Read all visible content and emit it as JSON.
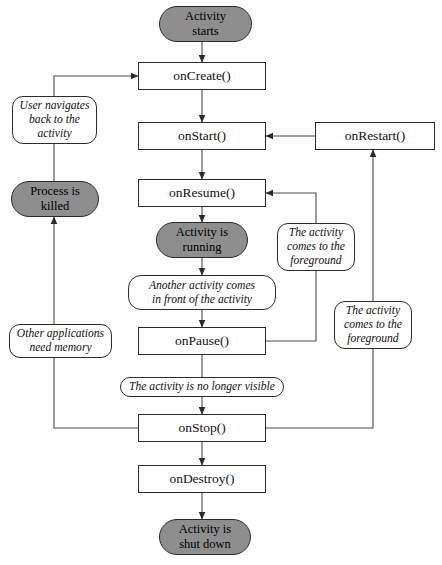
{
  "diagram": {
    "colors": {
      "state_fill": "#8e8e8e",
      "box_fill": "#ffffff",
      "stroke": "#2b2b2b",
      "background": "#ffffff"
    },
    "nodes": [
      {
        "id": "activity_starts",
        "label": "Activity\nstarts",
        "kind": "state",
        "x": 159,
        "y": 6,
        "w": 93,
        "h": 36
      },
      {
        "id": "on_create",
        "label": "onCreate()",
        "kind": "box",
        "x": 138,
        "y": 62,
        "w": 128,
        "h": 28
      },
      {
        "id": "user_navigates",
        "label": "User navigates\nback to the\nactivity",
        "kind": "cond",
        "x": 12,
        "y": 96,
        "w": 85,
        "h": 48
      },
      {
        "id": "on_start",
        "label": "onStart()",
        "kind": "box",
        "x": 138,
        "y": 122,
        "w": 128,
        "h": 28
      },
      {
        "id": "on_restart",
        "label": "onRestart()",
        "kind": "box",
        "x": 315,
        "y": 122,
        "w": 120,
        "h": 28
      },
      {
        "id": "process_killed",
        "label": "Process is\nkilled",
        "kind": "state",
        "x": 11,
        "y": 181,
        "w": 88,
        "h": 36
      },
      {
        "id": "on_resume",
        "label": "onResume()",
        "kind": "box",
        "x": 138,
        "y": 179,
        "w": 128,
        "h": 28
      },
      {
        "id": "activity_running",
        "label": "Activity is\nrunning",
        "kind": "state",
        "x": 156,
        "y": 222,
        "w": 92,
        "h": 36
      },
      {
        "id": "foreground_mid",
        "label": "The activity\ncomes to the\nforeground",
        "kind": "cond",
        "x": 277,
        "y": 223,
        "w": 78,
        "h": 48
      },
      {
        "id": "another_activity",
        "label": "Another activity comes\nin front of the activity",
        "kind": "cond",
        "x": 128,
        "y": 275,
        "w": 148,
        "h": 35
      },
      {
        "id": "foreground_low",
        "label": "The activity\ncomes to the\nforeground",
        "kind": "cond",
        "x": 334,
        "y": 301,
        "w": 78,
        "h": 48
      },
      {
        "id": "other_apps",
        "label": "Other applications\nneed memory",
        "kind": "cond",
        "x": 9,
        "y": 324,
        "w": 103,
        "h": 34
      },
      {
        "id": "on_pause",
        "label": "onPause()",
        "kind": "box",
        "x": 138,
        "y": 327,
        "w": 128,
        "h": 28
      },
      {
        "id": "no_longer_visible",
        "label": "The activity is no longer visible",
        "kind": "cond",
        "x": 120,
        "y": 377,
        "w": 164,
        "h": 20
      },
      {
        "id": "on_stop",
        "label": "onStop()",
        "kind": "box",
        "x": 138,
        "y": 414,
        "w": 128,
        "h": 28
      },
      {
        "id": "on_destroy",
        "label": "onDestroy()",
        "kind": "box",
        "x": 138,
        "y": 465,
        "w": 128,
        "h": 28
      },
      {
        "id": "activity_shutdown",
        "label": "Activity is\nshut down",
        "kind": "state",
        "x": 159,
        "y": 519,
        "w": 92,
        "h": 36
      }
    ],
    "edges": [
      {
        "id": "starts-to-create",
        "from": "activity_starts",
        "to": "on_create",
        "points": "202,42 202,62",
        "arrow": "down"
      },
      {
        "id": "create-to-start",
        "from": "on_create",
        "to": "on_start",
        "points": "202,90 202,122",
        "arrow": "down"
      },
      {
        "id": "start-to-resume",
        "from": "on_start",
        "to": "on_resume",
        "points": "202,150 202,179",
        "arrow": "down"
      },
      {
        "id": "resume-to-running",
        "from": "on_resume",
        "to": "activity_running",
        "points": "202,207 202,222",
        "arrow": "down"
      },
      {
        "id": "running-to-another",
        "from": "activity_running",
        "to": "another_activity",
        "points": "202,258 202,275",
        "arrow": "down"
      },
      {
        "id": "another-to-pause",
        "from": "another_activity",
        "to": "on_pause",
        "points": "202,310 202,327",
        "arrow": "down"
      },
      {
        "id": "pause-to-novisible",
        "from": "on_pause",
        "to": "no_longer_visible",
        "points": "202,355 202,377",
        "arrow": "none"
      },
      {
        "id": "novisible-to-stop",
        "from": "no_longer_visible",
        "to": "on_stop",
        "points": "202,397 202,414",
        "arrow": "down"
      },
      {
        "id": "stop-to-destroy",
        "from": "on_stop",
        "to": "on_destroy",
        "points": "202,442 202,465",
        "arrow": "down"
      },
      {
        "id": "destroy-to-shutdown",
        "from": "on_destroy",
        "to": "activity_shutdown",
        "points": "202,493 202,519",
        "arrow": "down"
      },
      {
        "id": "restart-to-start",
        "from": "on_restart",
        "to": "on_start",
        "points": "315,136 266,136",
        "arrow": "left"
      },
      {
        "id": "stop-to-restart",
        "from": "on_stop",
        "to": "on_restart",
        "points": "266,428 373,428 373,150",
        "arrow": "up"
      },
      {
        "id": "pause-to-resume",
        "from": "on_pause",
        "to": "on_resume",
        "points": "266,341 316,341 316,193 266,193",
        "arrow": "left"
      },
      {
        "id": "stop-left-to-killed",
        "from": "on_stop",
        "to": "process_killed",
        "points": "138,428 54,428 54,217",
        "arrow": "up"
      },
      {
        "id": "killed-back-to-create",
        "from": "process_killed",
        "to": "on_create",
        "points": "54,181 54,76 138,76",
        "arrow": "right"
      }
    ]
  }
}
